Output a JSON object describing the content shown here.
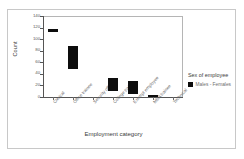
{
  "chart_data": {
    "type": "bar",
    "title": "",
    "xlabel": "Employment category",
    "ylabel": "Count",
    "ylim": [
      0,
      140
    ],
    "yticks": [
      "0",
      "20",
      "40",
      "60",
      "80",
      "100",
      "120",
      "140"
    ],
    "grid": false,
    "legend_position": "right",
    "categories": [
      "Clerical",
      "Office trainee",
      "Security officer",
      "College trainee",
      "Exempt employee",
      "MBA trainee",
      "Technical"
    ],
    "series": [
      {
        "name": "Males - Females",
        "color": "#0d0d0d",
        "ranges": [
          {
            "low": 112,
            "high": 118
          },
          {
            "low": 48,
            "high": 88
          },
          {
            "low": 0,
            "high": 0
          },
          {
            "low": 10,
            "high": 33
          },
          {
            "low": 5,
            "high": 28
          },
          {
            "low": 0,
            "high": 3
          },
          {
            "low": 0,
            "high": 0
          }
        ],
        "values": [
          115,
          68,
          0,
          21,
          16,
          1,
          0
        ]
      }
    ]
  },
  "legend": {
    "title": "Sex of employee",
    "items": [
      {
        "label": "Males - Females",
        "color": "#0d0d0d"
      }
    ]
  }
}
